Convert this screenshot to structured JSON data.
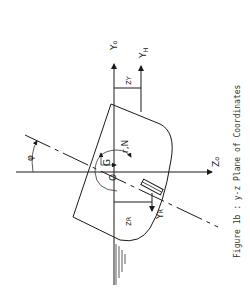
{
  "figure": {
    "caption": "Figure 1b : y-z Plane of Coordinates",
    "orientation": "rotated 90° (read with page turned clockwise)"
  },
  "axes": {
    "y_axis_label": "Y",
    "y_axis_sub": "o",
    "z_axis_label": "Z",
    "z_axis_sub": "o",
    "yh_label": "Y",
    "yh_sub": "H"
  },
  "points": {
    "origin": "O",
    "center_of_gravity": "G"
  },
  "annotations": {
    "yaw": "r,N",
    "roll_angle": "φ",
    "zy_label": "z",
    "zy_sub": "Y",
    "zr_label": "z",
    "zr_sub": "R",
    "yr_label": "Y",
    "yr_sub": "R"
  },
  "colors": {
    "line": "#1a1a1a",
    "background": "#ffffff"
  }
}
